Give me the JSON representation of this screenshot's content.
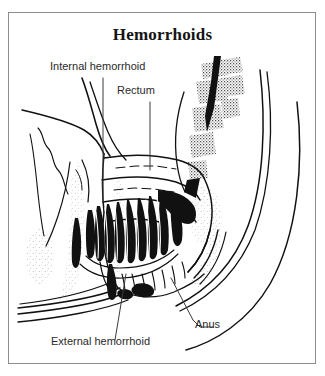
{
  "figure": {
    "title": "Hemorrhoids",
    "kind": "medical-line-drawing",
    "orientation": "sagittal-section",
    "frame_color": "#8d8d8d",
    "ink_color": "#111111",
    "background_color": "#ffffff"
  },
  "labels": {
    "internal_hemorrhoid": "Internal hemorrhoid",
    "rectum": "Rectum",
    "external_hemorrhoid": "External hemorrhoid",
    "anus": "Anus"
  },
  "structures": [
    {
      "name": "rectum",
      "description": "folded rectal wall above the anal canal"
    },
    {
      "name": "internal-hemorrhoid",
      "description": "dark engorged vein cluster inside the anal canal"
    },
    {
      "name": "external-hemorrhoid",
      "description": "dark swelling at the anal verge"
    },
    {
      "name": "anus",
      "description": "anal opening at the distal end of the canal"
    },
    {
      "name": "sacrum-coccyx",
      "description": "stippled vertebral bodies upper right"
    },
    {
      "name": "buttock-contour",
      "description": "sweeping outer body curves"
    }
  ]
}
